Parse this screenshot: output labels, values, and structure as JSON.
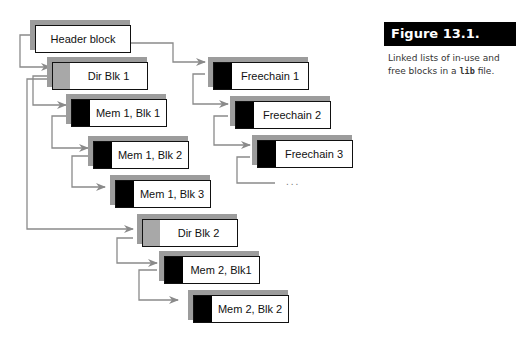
{
  "figure": {
    "title": "Figure 13.1.",
    "caption_before": "Linked lists of in-use and free blocks in a ",
    "caption_code": "lib",
    "caption_after": " file."
  },
  "blocks": {
    "header": "Header block",
    "dir1": "Dir Blk 1",
    "mem1blk1": "Mem 1,  Blk 1",
    "mem1blk2": "Mem 1, Blk 2",
    "mem1blk3": "Mem 1, Blk 3",
    "dir2": "Dir Blk 2",
    "mem2blk1": "Mem 2, Blk1",
    "mem2blk2": "Mem 2, Blk 2",
    "free1": "Freechain 1",
    "free2": "Freechain 2",
    "free3": "Freechain 3"
  },
  "continuation": "...",
  "colors": {
    "link_line": "#8a8a8a",
    "shadow": "#9c9c9c",
    "tab_black": "#000000",
    "tab_gray": "#a8a8a8"
  }
}
